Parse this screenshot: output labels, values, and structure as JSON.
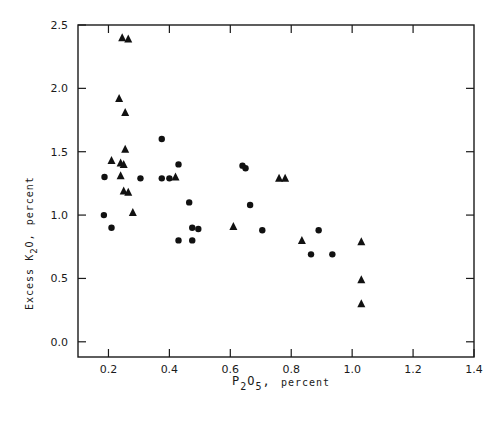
{
  "chart_data": {
    "type": "scatter",
    "title": "",
    "xlabel": "P2O5, percent",
    "ylabel": "Excess K2O, percent",
    "xlim": [
      0.1,
      1.4
    ],
    "ylim": [
      -0.12,
      2.5
    ],
    "x_ticks": [
      0.2,
      0.4,
      0.6,
      0.8,
      1.0,
      1.2,
      1.4
    ],
    "x_tick_labels": [
      "0.2",
      "0.4",
      "0.6",
      "0.8",
      "1.0",
      "1.2",
      "1.4"
    ],
    "y_ticks": [
      0.0,
      0.5,
      1.0,
      1.5,
      2.0,
      2.5
    ],
    "y_tick_labels": [
      "0.0",
      "0.5",
      "1.0",
      "1.5",
      "2.0",
      "2.5"
    ],
    "grid": false,
    "legend": null,
    "series": [
      {
        "name": "circles",
        "marker": "circle",
        "color": "#111111",
        "points": [
          [
            0.187,
            1.3
          ],
          [
            0.185,
            1.0
          ],
          [
            0.21,
            0.9
          ],
          [
            0.305,
            1.29
          ],
          [
            0.375,
            1.6
          ],
          [
            0.375,
            1.29
          ],
          [
            0.4,
            1.29
          ],
          [
            0.43,
            1.4
          ],
          [
            0.43,
            0.8
          ],
          [
            0.465,
            1.1
          ],
          [
            0.475,
            0.9
          ],
          [
            0.475,
            0.8
          ],
          [
            0.495,
            0.89
          ],
          [
            0.64,
            1.39
          ],
          [
            0.65,
            1.37
          ],
          [
            0.665,
            1.08
          ],
          [
            0.705,
            0.88
          ],
          [
            0.89,
            0.88
          ],
          [
            0.865,
            0.69
          ],
          [
            0.935,
            0.69
          ]
        ]
      },
      {
        "name": "triangles",
        "marker": "triangle",
        "color": "#111111",
        "points": [
          [
            0.245,
            2.4
          ],
          [
            0.265,
            2.39
          ],
          [
            0.235,
            1.92
          ],
          [
            0.255,
            1.81
          ],
          [
            0.255,
            1.52
          ],
          [
            0.21,
            1.43
          ],
          [
            0.24,
            1.41
          ],
          [
            0.25,
            1.4
          ],
          [
            0.24,
            1.31
          ],
          [
            0.25,
            1.19
          ],
          [
            0.265,
            1.18
          ],
          [
            0.28,
            1.02
          ],
          [
            0.42,
            1.3
          ],
          [
            0.61,
            0.91
          ],
          [
            0.76,
            1.29
          ],
          [
            0.78,
            1.29
          ],
          [
            0.835,
            0.8
          ],
          [
            1.03,
            0.79
          ],
          [
            1.03,
            0.49
          ],
          [
            1.03,
            0.3
          ]
        ]
      }
    ]
  },
  "labels": {
    "x_main": "P",
    "x_sub1": "2",
    "x_mid": "O",
    "x_sub2": "5",
    "x_comma": ",",
    "x_unit": "percent",
    "y_prefix": "Excess  K",
    "y_sub1": "2",
    "y_mid": "O,",
    "y_unit": "percent"
  },
  "colors": {
    "ink": "#1a1a1a",
    "background": "#ffffff"
  }
}
